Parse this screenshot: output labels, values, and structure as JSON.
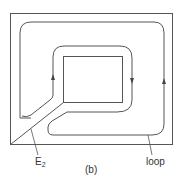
{
  "diagram": {
    "caption": "(b)",
    "labels": {
      "e2": {
        "main": "E",
        "sub": "2"
      },
      "loop": "loop"
    },
    "elements": [
      "outer-boundary-rectangle",
      "inner-rectangle",
      "diagonal-cut-line-E2",
      "outer-loop-path",
      "inner-loop-path",
      "arrow-up-outer-right",
      "arrow-down-inner-right",
      "arrow-up-inner-left"
    ],
    "stroke_color": "#555555"
  }
}
